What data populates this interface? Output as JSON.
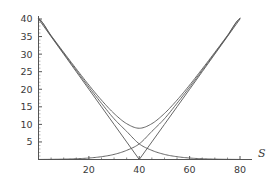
{
  "chart_data": {
    "type": "line",
    "title": "",
    "subtitle": "",
    "xlabel": "S",
    "ylabel": "",
    "xlim": [
      0,
      84
    ],
    "ylim": [
      0,
      42
    ],
    "grid": false,
    "legend": null,
    "xticks": [
      20,
      40,
      60,
      80
    ],
    "xtick_labels": [
      "20",
      "40",
      "60",
      "80"
    ],
    "yticks": [
      5,
      10,
      15,
      20,
      25,
      30,
      35,
      40
    ],
    "ytick_labels": [
      "5",
      "10",
      "15",
      "20",
      "25",
      "30",
      "35",
      "40"
    ],
    "x": [
      0,
      5,
      10,
      15,
      20,
      25,
      30,
      35,
      40,
      45,
      50,
      55,
      60,
      65,
      70,
      75,
      80
    ],
    "series": [
      {
        "name": "straddle-payoff",
        "style": "solid",
        "color": "#555555",
        "values": [
          40,
          35,
          30,
          25,
          20,
          15,
          10,
          5,
          0,
          5,
          10,
          15,
          20,
          25,
          30,
          35,
          40
        ]
      },
      {
        "name": "straddle-value",
        "style": "solid",
        "color": "#555555",
        "values": [
          40.2,
          35.3,
          30.5,
          25.8,
          21.2,
          16.9,
          13.1,
          10.2,
          8.9,
          10.2,
          13.1,
          16.9,
          21.2,
          25.8,
          30.5,
          35.3,
          40.2
        ]
      },
      {
        "name": "put-value",
        "style": "solid",
        "color": "#555555",
        "values": [
          40.1,
          35.15,
          30.25,
          25.4,
          20.6,
          16.0,
          11.6,
          8.0,
          4.45,
          2.6,
          1.45,
          0.8,
          0.42,
          0.22,
          0.11,
          0.05,
          0.02
        ]
      },
      {
        "name": "call-value",
        "style": "solid",
        "color": "#555555",
        "values": [
          0.02,
          0.05,
          0.11,
          0.22,
          0.42,
          0.8,
          1.45,
          2.6,
          4.45,
          8.0,
          11.6,
          16.0,
          20.6,
          25.4,
          30.25,
          35.15,
          40.1
        ]
      }
    ],
    "colors": {
      "axis": "#555555",
      "curve": "#555555",
      "text": "#3a3a3a",
      "background": "#ffffff"
    }
  }
}
